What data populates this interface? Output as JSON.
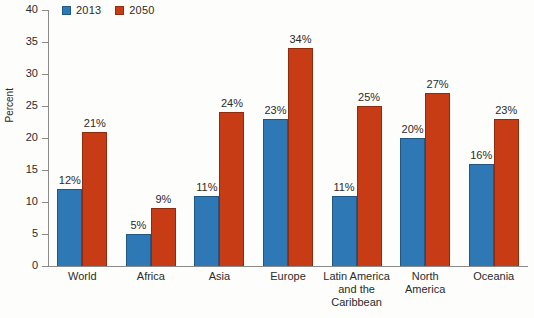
{
  "chart_data": {
    "type": "bar",
    "title": "",
    "subtitle": "",
    "xlabel": "",
    "ylabel": "Percent",
    "ylim": [
      0,
      40
    ],
    "yticks": [
      0,
      5,
      10,
      15,
      20,
      25,
      30,
      35,
      40
    ],
    "grid": false,
    "legend_position": "top-left",
    "value_suffix": "%",
    "categories": [
      "World",
      "Africa",
      "Asia",
      "Europe",
      "Latin America and the Caribbean",
      "North America",
      "Oceania"
    ],
    "category_lines": [
      [
        "World"
      ],
      [
        "Africa"
      ],
      [
        "Asia"
      ],
      [
        "Europe"
      ],
      [
        "Latin America",
        "and the",
        "Caribbean"
      ],
      [
        "North",
        "America"
      ],
      [
        "Oceania"
      ]
    ],
    "series": [
      {
        "name": "2013",
        "color": "#2e79b5",
        "values": [
          12,
          5,
          11,
          23,
          11,
          20,
          16
        ],
        "labels": [
          "12%",
          "5%",
          "11%",
          "23%",
          "11%",
          "20%",
          "16%"
        ]
      },
      {
        "name": "2050",
        "color": "#c83c15",
        "values": [
          21,
          9,
          24,
          34,
          25,
          27,
          23
        ],
        "labels": [
          "21%",
          "9%",
          "24%",
          "34%",
          "25%",
          "27%",
          "23%"
        ]
      }
    ]
  },
  "legend": {
    "entries": [
      {
        "label": "2013",
        "color": "#2e79b5"
      },
      {
        "label": "2050",
        "color": "#c83c15"
      }
    ]
  },
  "axis": {
    "y_title": "Percent",
    "y_tick_labels": [
      "40",
      "35",
      "30",
      "25",
      "20",
      "15",
      "10",
      "5",
      "0"
    ]
  }
}
